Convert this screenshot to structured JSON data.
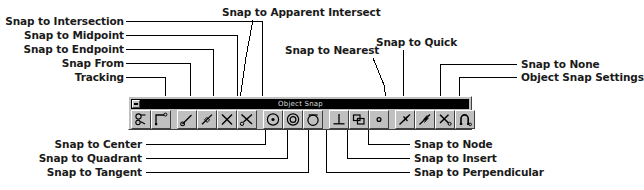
{
  "toolbar": {
    "title": "Object Snap",
    "system_menu_icon": "system-menu-icon",
    "buttons": [
      {
        "id": "tracking",
        "label": "Tracking",
        "icon": "tracking-icon"
      },
      {
        "id": "snap-from",
        "label": "Snap From",
        "icon": "snap-from-icon"
      },
      {
        "id": "snap-to-endpoint",
        "label": "Snap to Endpoint",
        "icon": "endpoint-icon"
      },
      {
        "id": "snap-to-midpoint",
        "label": "Snap to Midpoint",
        "icon": "midpoint-icon"
      },
      {
        "id": "snap-to-intersection",
        "label": "Snap to Intersection",
        "icon": "intersection-icon"
      },
      {
        "id": "snap-to-apparent-intersect",
        "label": "Snap to Apparent Intersect",
        "icon": "apparent-intersect-icon"
      },
      {
        "id": "snap-to-center",
        "label": "Snap to Center",
        "icon": "center-icon"
      },
      {
        "id": "snap-to-quadrant",
        "label": "Snap to Quadrant",
        "icon": "quadrant-icon"
      },
      {
        "id": "snap-to-tangent",
        "label": "Snap to Tangent",
        "icon": "tangent-icon"
      },
      {
        "id": "snap-to-perpendicular",
        "label": "Snap to Perpendicular",
        "icon": "perpendicular-icon"
      },
      {
        "id": "snap-to-insert",
        "label": "Snap to Insert",
        "icon": "insert-icon"
      },
      {
        "id": "snap-to-node",
        "label": "Snap to Node",
        "icon": "node-icon"
      },
      {
        "id": "snap-to-nearest",
        "label": "Snap to Nearest",
        "icon": "nearest-icon"
      },
      {
        "id": "snap-to-quick",
        "label": "Snap to Quick",
        "icon": "quick-icon"
      },
      {
        "id": "snap-to-none",
        "label": "Snap to None",
        "icon": "none-icon"
      },
      {
        "id": "object-snap-settings",
        "label": "Object Snap Settings",
        "icon": "osnap-settings-magnet-icon"
      }
    ]
  },
  "callouts": {
    "top_left": [
      {
        "id": "snap-to-intersection",
        "text": "Snap to Intersection"
      },
      {
        "id": "snap-to-midpoint",
        "text": "Snap to Midpoint"
      },
      {
        "id": "snap-to-endpoint",
        "text": "Snap to Endpoint"
      },
      {
        "id": "snap-from",
        "text": "Snap From"
      },
      {
        "id": "tracking",
        "text": "Tracking"
      }
    ],
    "top_center": [
      {
        "id": "snap-to-apparent-intersect",
        "text": "Snap to Apparent Intersect"
      },
      {
        "id": "snap-to-nearest",
        "text": "Snap to Nearest"
      },
      {
        "id": "snap-to-quick",
        "text": "Snap to Quick"
      }
    ],
    "top_right": [
      {
        "id": "snap-to-none",
        "text": "Snap to None"
      },
      {
        "id": "object-snap-settings",
        "text": "Object Snap Settings"
      }
    ],
    "bottom_left": [
      {
        "id": "snap-to-center",
        "text": "Snap to Center"
      },
      {
        "id": "snap-to-quadrant",
        "text": "Snap to Quadrant"
      },
      {
        "id": "snap-to-tangent",
        "text": "Snap to Tangent"
      }
    ],
    "bottom_right": [
      {
        "id": "snap-to-node",
        "text": "Snap to Node"
      },
      {
        "id": "snap-to-insert",
        "text": "Snap to Insert"
      },
      {
        "id": "snap-to-perpendicular",
        "text": "Snap to Perpendicular"
      }
    ]
  },
  "colors": {
    "page_background": "#ffffff",
    "toolbar_face": "#c0c0c0",
    "titlebar": "#000000",
    "titlebar_text": "#d8d8d8",
    "leader_line": "#000000",
    "label_text": "#1a1a1a"
  }
}
